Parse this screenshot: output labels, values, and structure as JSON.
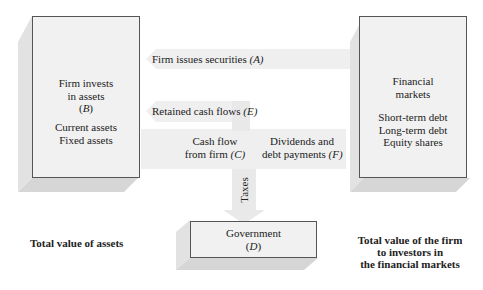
{
  "diagram": {
    "left_box": {
      "title_lines": [
        "Firm invests",
        "in assets",
        "(B)"
      ],
      "items": [
        "Current assets",
        "Fixed assets"
      ],
      "caption": "Total value of assets"
    },
    "right_box": {
      "title_lines": [
        "Financial",
        "markets"
      ],
      "items": [
        "Short-term debt",
        "Long-term debt",
        "Equity shares"
      ],
      "caption_lines": [
        "Total value of the firm",
        "to investors in",
        "the financial markets"
      ]
    },
    "government_box": {
      "title_lines": [
        "Government",
        "(D)"
      ]
    },
    "flows": {
      "a": {
        "text": "Firm issues securities ",
        "letter": "(A)"
      },
      "e": {
        "text": "Retained cash flows ",
        "letter": "(E)"
      },
      "c": {
        "line1": "Cash flow",
        "line2": "from firm ",
        "letter": "(C)"
      },
      "f": {
        "line1": "Dividends and",
        "line2": "debt payments ",
        "letter": "(F)"
      },
      "taxes": "Taxes"
    },
    "colors": {
      "box_fill": "#f1f1f1",
      "box_border": "#555555",
      "arrow_fill": "#efefef",
      "shadow": "#d9d9d9"
    }
  }
}
